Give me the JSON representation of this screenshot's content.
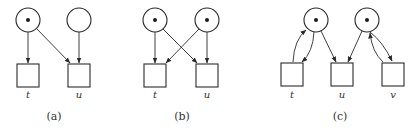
{
  "figure": {
    "panels": [
      {
        "caption": "(a)",
        "places": [
          {
            "id": "p1",
            "tokens": 1
          },
          {
            "id": "p2",
            "tokens": 0
          }
        ],
        "transitions": [
          {
            "label": "t"
          },
          {
            "label": "u"
          }
        ],
        "arcs": [
          [
            "p1",
            "t"
          ],
          [
            "p1",
            "u"
          ],
          [
            "p2",
            "u"
          ]
        ]
      },
      {
        "caption": "(b)",
        "places": [
          {
            "id": "p1",
            "tokens": 1
          },
          {
            "id": "p2",
            "tokens": 1
          }
        ],
        "transitions": [
          {
            "label": "t"
          },
          {
            "label": "u"
          }
        ],
        "arcs": [
          [
            "p1",
            "t"
          ],
          [
            "p1",
            "u"
          ],
          [
            "p2",
            "t"
          ],
          [
            "p2",
            "u"
          ]
        ]
      },
      {
        "caption": "(c)",
        "places": [
          {
            "id": "p1",
            "tokens": 1
          },
          {
            "id": "p2",
            "tokens": 1
          }
        ],
        "transitions": [
          {
            "label": "t"
          },
          {
            "label": "u"
          },
          {
            "label": "v"
          }
        ],
        "arcs": [
          [
            "p1",
            "t"
          ],
          [
            "t",
            "p1"
          ],
          [
            "p1",
            "u"
          ],
          [
            "p2",
            "u"
          ],
          [
            "p2",
            "v"
          ],
          [
            "v",
            "p2"
          ]
        ]
      }
    ]
  }
}
